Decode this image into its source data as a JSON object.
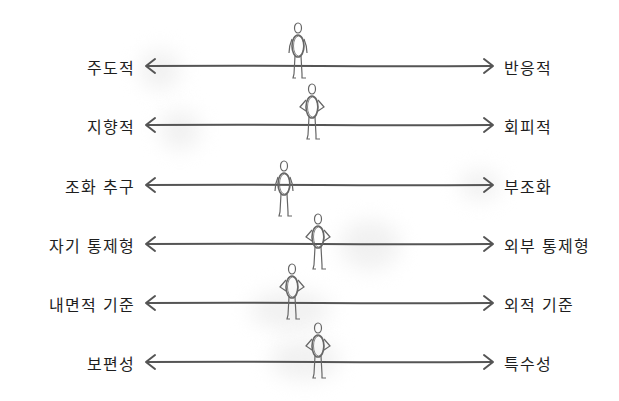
{
  "diagram": {
    "type": "bipolar-spectrum",
    "line_color": "#555555",
    "figure_color": "#666666",
    "rows": [
      {
        "left": "주도적",
        "right": "반응적",
        "y": 66,
        "figure_x": 298,
        "figure_top": 22,
        "pose": "arms-down"
      },
      {
        "left": "지향적",
        "right": "회피적",
        "y": 125,
        "figure_x": 312,
        "figure_top": 83,
        "pose": "hands-on-hips"
      },
      {
        "left": "조화 추구",
        "right": "부조화",
        "y": 185,
        "figure_x": 284,
        "figure_top": 160,
        "pose": "arms-down"
      },
      {
        "left": "자기 통제형",
        "right": "외부 통제형",
        "y": 244,
        "figure_x": 318,
        "figure_top": 213,
        "pose": "hands-on-hips"
      },
      {
        "left": "내면적 기준",
        "right": "외적 기준",
        "y": 303,
        "figure_x": 292,
        "figure_top": 263,
        "pose": "hands-on-hips"
      },
      {
        "left": "보편성",
        "right": "특수성",
        "y": 362,
        "figure_x": 318,
        "figure_top": 322,
        "pose": "hands-on-hips"
      }
    ]
  }
}
